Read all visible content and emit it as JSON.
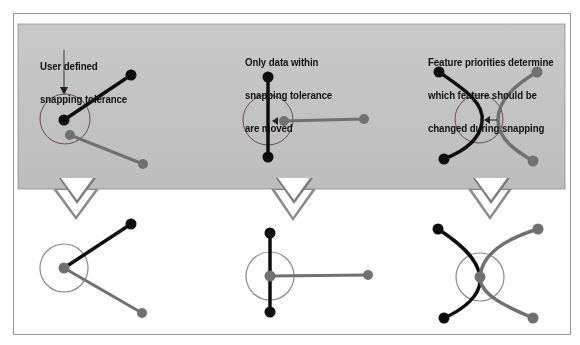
{
  "colors": {
    "background": "#ffffff",
    "frame": "#9a9a9a",
    "band": "#c4c4c4",
    "band_border": "#8e8e8e",
    "black_feature": "#111111",
    "gray_feature": "#6f6f6f",
    "tolerance_circle": "#6a6a6a"
  },
  "panels": [
    {
      "id": "user-defined-tolerance",
      "caption_lines": [
        "User defined",
        "snapping tolerance"
      ],
      "before": "Black and gray line features with nearby endpoints; pointer arrow marks the tolerance circle",
      "after": "Gray endpoint snapped to the black endpoint inside tolerance circle"
    },
    {
      "id": "only-data-within-tolerance",
      "caption_lines": [
        "Only data within",
        "snapping tolerance",
        "are moved"
      ],
      "before": "Vertical black line and horizontal gray line ending inside tolerance circle",
      "after": "Gray line endpoint moved onto the black vertical line"
    },
    {
      "id": "feature-priorities",
      "caption_lines": [
        "Feature priorities determine",
        "which feature should be",
        "changed during snapping"
      ],
      "before": "Two curved features (black and gray) near each other within tolerance circle",
      "after": "Gray curve reshaped to meet the black curve at a shared vertex"
    }
  ]
}
